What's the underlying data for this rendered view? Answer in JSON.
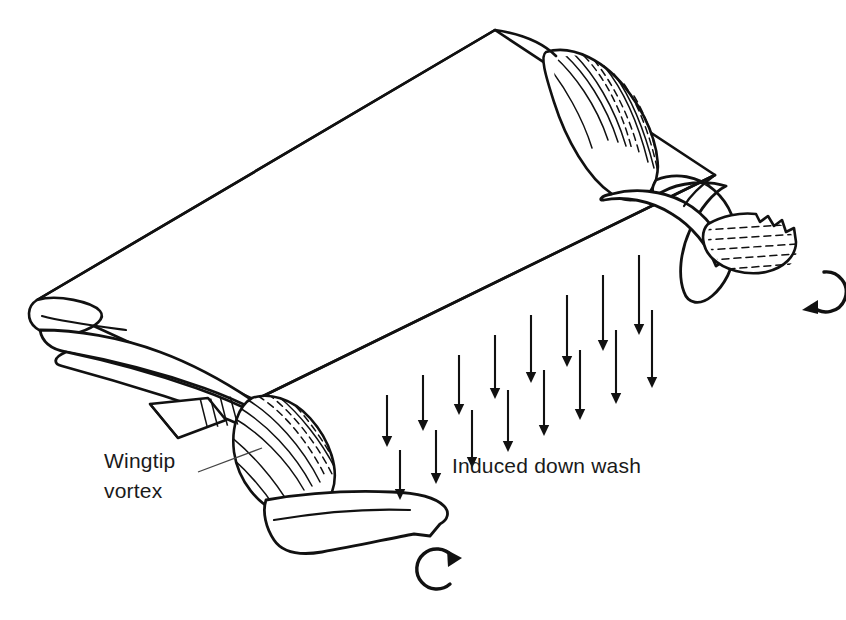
{
  "figure": {
    "background_color": "#ffffff",
    "ink_color": "#111111",
    "width": 846,
    "height": 620
  },
  "labels": {
    "wingtip_vortex": {
      "line1": "Wingtip",
      "line2": "vortex",
      "x": 104,
      "y": 468,
      "font_size": 21
    },
    "induced_downwash": {
      "text": "Induced down wash",
      "x": 452,
      "y": 473,
      "font_size": 21
    }
  },
  "wing": {
    "shape": "parallelogram-planform-in-perspective",
    "leading_edge": {
      "from": [
        37,
        300
      ],
      "to": [
        495,
        30
      ]
    },
    "trailing_edge": {
      "from": [
        255,
        400
      ],
      "to": [
        715,
        175
      ]
    },
    "left_tip": [
      37,
      300
    ],
    "right_tip": [
      495,
      30
    ],
    "left_trailing_corner": [
      255,
      400
    ],
    "right_trailing_corner": [
      715,
      175
    ]
  },
  "vortices": [
    {
      "name": "left-wingtip-vortex",
      "side": "left",
      "rolled_core_hatched": true,
      "rotation_arrow": {
        "name": "left-rotation-arrow",
        "center": [
          435,
          568
        ],
        "radius": 20,
        "direction": "counter-clockwise-opening-right",
        "arrowhead_position": "top-right"
      }
    },
    {
      "name": "right-wingtip-vortex",
      "side": "right",
      "rolled_core_hatched": true,
      "rotation_arrow": {
        "name": "right-rotation-arrow",
        "center": [
          807,
          288
        ],
        "radius": 20,
        "direction": "clockwise-opening-right",
        "arrowhead_position": "bottom-left"
      }
    }
  ],
  "downwash": {
    "label": "Induced down wash",
    "direction": "downward",
    "arrow_color": "#111111",
    "rows": [
      {
        "name": "upper-row",
        "count": 8,
        "start": [
          387,
          395
        ],
        "step": [
          36,
          -20
        ],
        "lengths": [
          52,
          56,
          60,
          64,
          68,
          72,
          76,
          80
        ]
      },
      {
        "name": "lower-row",
        "count": 8,
        "start": [
          400,
          450
        ],
        "step": [
          36,
          -20
        ],
        "lengths": [
          50,
          54,
          58,
          62,
          66,
          70,
          74,
          78
        ]
      }
    ]
  },
  "chart_data": {
    "type": "diagram",
    "annotations": [
      "Wingtip vortex",
      "Induced down wash"
    ],
    "elements": [
      "finite wing planform",
      "left trailing vortex sheet",
      "right trailing vortex sheet",
      "downwash arrow field",
      "rotation direction arrows"
    ]
  }
}
